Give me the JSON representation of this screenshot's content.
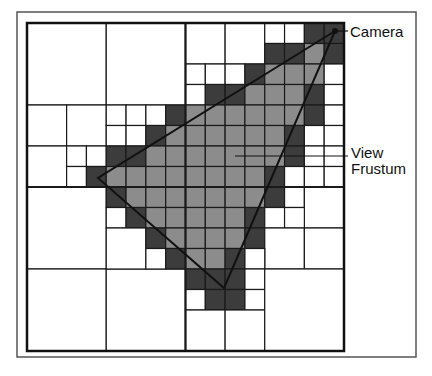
{
  "diagram": {
    "labels": {
      "camera": "Camera",
      "view_line1": "View",
      "view_line2": "Frustum"
    },
    "colors": {
      "white": "#ffffff",
      "dark": "#3c3c3c",
      "light": "#8c8c8c",
      "line": "#1a1a1a",
      "frame": "#555555"
    },
    "frame": {
      "x": 17,
      "y": 12,
      "w": 399,
      "h": 345
    },
    "grid": {
      "x": 27,
      "y": 23,
      "w": 317,
      "h": 328,
      "n": 16
    },
    "triangle": {
      "camera": [
        335,
        31
      ],
      "left": [
        98,
        178
      ],
      "bottom": [
        224,
        288
      ]
    },
    "cells": [
      [
        0,
        0,
        4,
        "white"
      ],
      [
        4,
        0,
        4,
        "white"
      ],
      [
        0,
        4,
        2,
        "white"
      ],
      [
        2,
        4,
        2,
        "white"
      ],
      [
        0,
        6,
        2,
        "white"
      ],
      [
        2,
        6,
        1,
        "white"
      ],
      [
        3,
        6,
        1,
        "white"
      ],
      [
        2,
        7,
        1,
        "white"
      ],
      [
        3,
        7,
        1,
        "dark"
      ],
      [
        4,
        4,
        1,
        "white"
      ],
      [
        5,
        4,
        1,
        "white"
      ],
      [
        6,
        4,
        1,
        "white"
      ],
      [
        7,
        4,
        1,
        "dark"
      ],
      [
        4,
        5,
        1,
        "white"
      ],
      [
        5,
        5,
        1,
        "white"
      ],
      [
        6,
        5,
        1,
        "dark"
      ],
      [
        7,
        5,
        1,
        "light"
      ],
      [
        4,
        6,
        1,
        "dark"
      ],
      [
        5,
        6,
        1,
        "dark"
      ],
      [
        6,
        6,
        1,
        "light"
      ],
      [
        7,
        6,
        1,
        "light"
      ],
      [
        4,
        7,
        1,
        "light"
      ],
      [
        5,
        7,
        1,
        "light"
      ],
      [
        6,
        7,
        1,
        "light"
      ],
      [
        7,
        7,
        1,
        "light"
      ],
      [
        8,
        0,
        2,
        "white"
      ],
      [
        10,
        0,
        2,
        "white"
      ],
      [
        12,
        0,
        1,
        "white"
      ],
      [
        13,
        0,
        1,
        "white"
      ],
      [
        14,
        0,
        1,
        "dark"
      ],
      [
        15,
        0,
        1,
        "dark"
      ],
      [
        12,
        1,
        1,
        "dark"
      ],
      [
        13,
        1,
        1,
        "dark"
      ],
      [
        14,
        1,
        1,
        "light"
      ],
      [
        15,
        1,
        1,
        "dark"
      ],
      [
        8,
        2,
        1,
        "white"
      ],
      [
        9,
        2,
        1,
        "white"
      ],
      [
        10,
        2,
        1,
        "white"
      ],
      [
        11,
        2,
        1,
        "dark"
      ],
      [
        12,
        2,
        1,
        "light"
      ],
      [
        13,
        2,
        1,
        "light"
      ],
      [
        14,
        2,
        1,
        "light"
      ],
      [
        15,
        2,
        1,
        "white"
      ],
      [
        8,
        3,
        1,
        "white"
      ],
      [
        9,
        3,
        1,
        "dark"
      ],
      [
        10,
        3,
        1,
        "dark"
      ],
      [
        11,
        3,
        1,
        "light"
      ],
      [
        12,
        3,
        1,
        "light"
      ],
      [
        13,
        3,
        1,
        "light"
      ],
      [
        14,
        3,
        1,
        "dark"
      ],
      [
        15,
        3,
        1,
        "white"
      ],
      [
        8,
        4,
        1,
        "light"
      ],
      [
        9,
        4,
        1,
        "light"
      ],
      [
        10,
        4,
        1,
        "light"
      ],
      [
        11,
        4,
        1,
        "light"
      ],
      [
        12,
        4,
        1,
        "light"
      ],
      [
        13,
        4,
        1,
        "light"
      ],
      [
        14,
        4,
        1,
        "dark"
      ],
      [
        15,
        4,
        1,
        "white"
      ],
      [
        8,
        5,
        1,
        "light"
      ],
      [
        9,
        5,
        1,
        "light"
      ],
      [
        10,
        5,
        1,
        "light"
      ],
      [
        11,
        5,
        1,
        "light"
      ],
      [
        12,
        5,
        1,
        "light"
      ],
      [
        13,
        5,
        1,
        "dark"
      ],
      [
        14,
        5,
        1,
        "white"
      ],
      [
        15,
        5,
        1,
        "white"
      ],
      [
        8,
        6,
        1,
        "light"
      ],
      [
        9,
        6,
        1,
        "light"
      ],
      [
        10,
        6,
        1,
        "light"
      ],
      [
        11,
        6,
        1,
        "light"
      ],
      [
        12,
        6,
        1,
        "light"
      ],
      [
        13,
        6,
        1,
        "dark"
      ],
      [
        14,
        6,
        1,
        "white"
      ],
      [
        15,
        6,
        1,
        "white"
      ],
      [
        8,
        7,
        1,
        "light"
      ],
      [
        9,
        7,
        1,
        "light"
      ],
      [
        10,
        7,
        1,
        "light"
      ],
      [
        11,
        7,
        1,
        "light"
      ],
      [
        12,
        7,
        1,
        "dark"
      ],
      [
        13,
        7,
        1,
        "white"
      ],
      [
        14,
        7,
        1,
        "white"
      ],
      [
        15,
        7,
        1,
        "white"
      ],
      [
        0,
        8,
        4,
        "white"
      ],
      [
        0,
        12,
        4,
        "white"
      ],
      [
        4,
        12,
        4,
        "white"
      ],
      [
        4,
        8,
        1,
        "dark"
      ],
      [
        5,
        8,
        1,
        "light"
      ],
      [
        6,
        8,
        1,
        "light"
      ],
      [
        7,
        8,
        1,
        "light"
      ],
      [
        4,
        9,
        1,
        "white"
      ],
      [
        5,
        9,
        1,
        "dark"
      ],
      [
        6,
        9,
        1,
        "light"
      ],
      [
        7,
        9,
        1,
        "light"
      ],
      [
        4,
        10,
        2,
        "white"
      ],
      [
        6,
        10,
        1,
        "dark"
      ],
      [
        7,
        10,
        1,
        "light"
      ],
      [
        6,
        11,
        1,
        "white"
      ],
      [
        7,
        11,
        1,
        "dark"
      ],
      [
        8,
        8,
        1,
        "light"
      ],
      [
        9,
        8,
        1,
        "light"
      ],
      [
        10,
        8,
        1,
        "light"
      ],
      [
        11,
        8,
        1,
        "light"
      ],
      [
        12,
        8,
        1,
        "dark"
      ],
      [
        13,
        8,
        1,
        "white"
      ],
      [
        14,
        8,
        2,
        "white"
      ],
      [
        8,
        9,
        1,
        "light"
      ],
      [
        9,
        9,
        1,
        "light"
      ],
      [
        10,
        9,
        1,
        "light"
      ],
      [
        11,
        9,
        1,
        "dark"
      ],
      [
        12,
        9,
        1,
        "white"
      ],
      [
        13,
        9,
        1,
        "white"
      ],
      [
        8,
        10,
        1,
        "light"
      ],
      [
        9,
        10,
        1,
        "light"
      ],
      [
        10,
        10,
        1,
        "light"
      ],
      [
        11,
        10,
        1,
        "dark"
      ],
      [
        12,
        10,
        2,
        "white"
      ],
      [
        14,
        10,
        2,
        "white"
      ],
      [
        8,
        11,
        1,
        "light"
      ],
      [
        9,
        11,
        1,
        "light"
      ],
      [
        10,
        11,
        1,
        "dark"
      ],
      [
        11,
        11,
        1,
        "white"
      ],
      [
        8,
        12,
        1,
        "dark"
      ],
      [
        9,
        12,
        1,
        "dark"
      ],
      [
        10,
        12,
        1,
        "dark"
      ],
      [
        11,
        12,
        1,
        "white"
      ],
      [
        8,
        13,
        1,
        "white"
      ],
      [
        9,
        13,
        1,
        "dark"
      ],
      [
        10,
        13,
        1,
        "dark"
      ],
      [
        11,
        13,
        1,
        "white"
      ],
      [
        8,
        14,
        2,
        "white"
      ],
      [
        10,
        14,
        2,
        "white"
      ],
      [
        12,
        12,
        4,
        "white"
      ]
    ],
    "leaders": {
      "camera": [
        [
          337,
          31
        ],
        [
          348,
          31
        ]
      ],
      "view": [
        [
          235,
          156
        ],
        [
          348,
          156
        ]
      ]
    }
  }
}
